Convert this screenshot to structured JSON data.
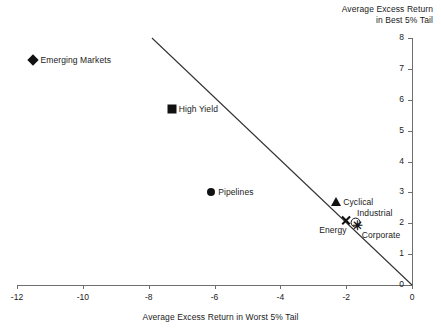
{
  "chart_data": {
    "type": "scatter",
    "title": "",
    "xlabel": "Average Excess Return in Worst 5% Tail",
    "ylabel": "Average Excess Return in Best 5% Tail",
    "xlim": [
      -12,
      0
    ],
    "ylim": [
      0,
      8
    ],
    "xticks": [
      -12,
      -10,
      -8,
      -6,
      -4,
      -2,
      0
    ],
    "xtick_labels": [
      "-12",
      "-10",
      "-8",
      "-6",
      "-4",
      "-2",
      "0"
    ],
    "yticks": [
      0,
      1,
      2,
      3,
      4,
      5,
      6,
      7,
      8
    ],
    "ytick_labels": [
      "0",
      "1",
      "2",
      "3",
      "4",
      "5",
      "6",
      "7",
      "8"
    ],
    "grid": false,
    "legend": "none",
    "y_axis_position": "right",
    "points": [
      {
        "label": "Emerging Markets",
        "x": -11.5,
        "y": 7.3,
        "marker": "diamond",
        "label_pos": "right"
      },
      {
        "label": "High Yield",
        "x": -7.3,
        "y": 5.7,
        "marker": "square",
        "label_pos": "right"
      },
      {
        "label": "Pipelines",
        "x": -6.1,
        "y": 3.0,
        "marker": "circle",
        "label_pos": "right"
      },
      {
        "label": "Cyclical",
        "x": -2.3,
        "y": 2.7,
        "marker": "triangle",
        "label_pos": "right"
      },
      {
        "label": "Energy",
        "x": -2.0,
        "y": 2.1,
        "marker": "x",
        "label_pos": "below-left"
      },
      {
        "label": "Industrial",
        "x": -1.7,
        "y": 2.0,
        "marker": "circle-open",
        "label_pos": "above-right"
      },
      {
        "label": "Corporate",
        "x": -1.65,
        "y": 1.95,
        "marker": "asterisk",
        "label_pos": "below-right"
      }
    ],
    "trend_line": {
      "label": "fitted trend line",
      "x_start": -7.9,
      "y_start": 8.0,
      "x_end": 0.0,
      "y_end": 0.0
    },
    "colors": {
      "marker": "#111111",
      "axis": "#6e6e6e",
      "text": "#1a1a1a",
      "trend": "#333333",
      "background": "#ffffff"
    }
  },
  "axis_titles": {
    "y_line1": "Average Excess Return",
    "y_line2": "in Best 5% Tail",
    "x": "Average Excess Return in Worst 5% Tail"
  },
  "marker_glyphs": {
    "asterisk": "✳"
  }
}
